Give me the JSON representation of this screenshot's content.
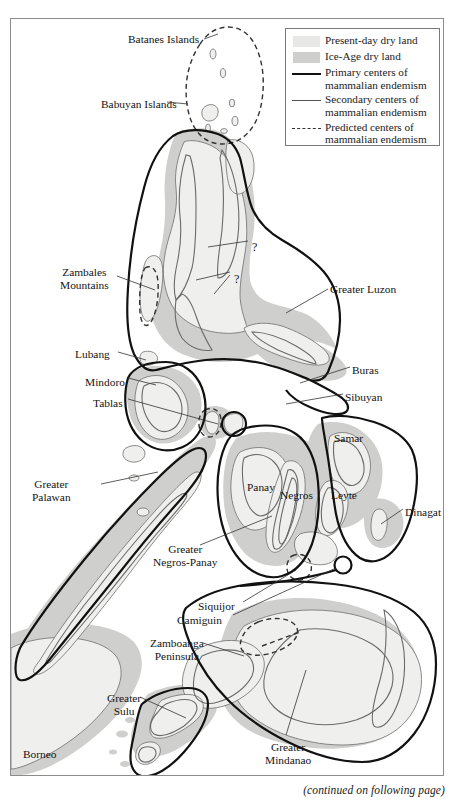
{
  "figure": {
    "caption": "(continued on following page)"
  },
  "legend": {
    "items": [
      {
        "key": "swatch-light",
        "label": "Present-day dry land",
        "color": "#e8e8e6"
      },
      {
        "key": "swatch-dark",
        "label": "Ice-Age dry land",
        "color": "#cfcfcd"
      },
      {
        "key": "line-thick",
        "label": "Primary centers of\nmammalian endemism",
        "color": "#111111"
      },
      {
        "key": "line-thin",
        "label": "Secondary centers of\nmammalian endemism",
        "color": "#555555"
      },
      {
        "key": "line-dashed",
        "label": "Predicted centers of\nmammalian endemism",
        "color": "#333333"
      }
    ]
  },
  "map": {
    "labels": [
      {
        "id": "batanes-islands",
        "text": "Batanes Islands",
        "x": 128,
        "y": 33,
        "align": "left"
      },
      {
        "id": "babuyan-islands",
        "text": "Babuyan Islands",
        "x": 101,
        "y": 98,
        "align": "left"
      },
      {
        "id": "zambales-mountains",
        "text": "Zambales\nMountains",
        "x": 60,
        "y": 266,
        "align": "center"
      },
      {
        "id": "greater-luzon",
        "text": "Greater Luzon",
        "x": 330,
        "y": 283,
        "align": "left"
      },
      {
        "id": "lubang",
        "text": "Lubang",
        "x": 75,
        "y": 348,
        "align": "left"
      },
      {
        "id": "mindoro",
        "text": "Mindoro",
        "x": 85,
        "y": 376,
        "align": "left"
      },
      {
        "id": "tablas",
        "text": "Tablas",
        "x": 93,
        "y": 397,
        "align": "left"
      },
      {
        "id": "buras",
        "text": "Buras",
        "x": 352,
        "y": 364,
        "align": "left"
      },
      {
        "id": "sibuyan",
        "text": "Sibuyan",
        "x": 345,
        "y": 391,
        "align": "left"
      },
      {
        "id": "samar",
        "text": "Samar",
        "x": 334,
        "y": 432,
        "align": "left"
      },
      {
        "id": "panay",
        "text": "Panay",
        "x": 247,
        "y": 481,
        "align": "left"
      },
      {
        "id": "negros",
        "text": "Negros",
        "x": 280,
        "y": 489,
        "align": "left"
      },
      {
        "id": "leyte",
        "text": "Leyte",
        "x": 331,
        "y": 489,
        "align": "left"
      },
      {
        "id": "dinagat",
        "text": "Dinagat",
        "x": 405,
        "y": 506,
        "align": "left"
      },
      {
        "id": "greater-palawan",
        "text": "Greater\nPalawan",
        "x": 32,
        "y": 478,
        "align": "center"
      },
      {
        "id": "greater-negros-panay",
        "text": "Greater\nNegros-Panay",
        "x": 153,
        "y": 543,
        "align": "center"
      },
      {
        "id": "siquijor",
        "text": "Siquijor",
        "x": 198,
        "y": 600,
        "align": "left"
      },
      {
        "id": "camiguin",
        "text": "Camiguin",
        "x": 177,
        "y": 614,
        "align": "left"
      },
      {
        "id": "zamboanga-peninsula",
        "text": "Zamboanga\nPeninsula",
        "x": 150,
        "y": 637,
        "align": "center"
      },
      {
        "id": "greater-sulu",
        "text": "Greater\nSulu",
        "x": 107,
        "y": 692,
        "align": "center"
      },
      {
        "id": "borneo",
        "text": "Borneo",
        "x": 23,
        "y": 748,
        "align": "left"
      },
      {
        "id": "greater-mindanao",
        "text": "Greater\nMindanao",
        "x": 265,
        "y": 741,
        "align": "center"
      }
    ],
    "annotations": [
      {
        "id": "question-mark-north",
        "text": "?",
        "x": 252,
        "y": 240
      },
      {
        "id": "question-mark-south",
        "text": "?",
        "x": 234,
        "y": 272
      }
    ],
    "colors": {
      "present_day_dry_land": "#e8e8e6",
      "ice_age_dry_land": "#cfcfcd",
      "primary_center_line": "#111111",
      "secondary_center_line": "#6a6a6a",
      "predicted_center_line": "#333333",
      "coastline": "#5a5a5a",
      "frame": "#8c8c8c"
    }
  }
}
